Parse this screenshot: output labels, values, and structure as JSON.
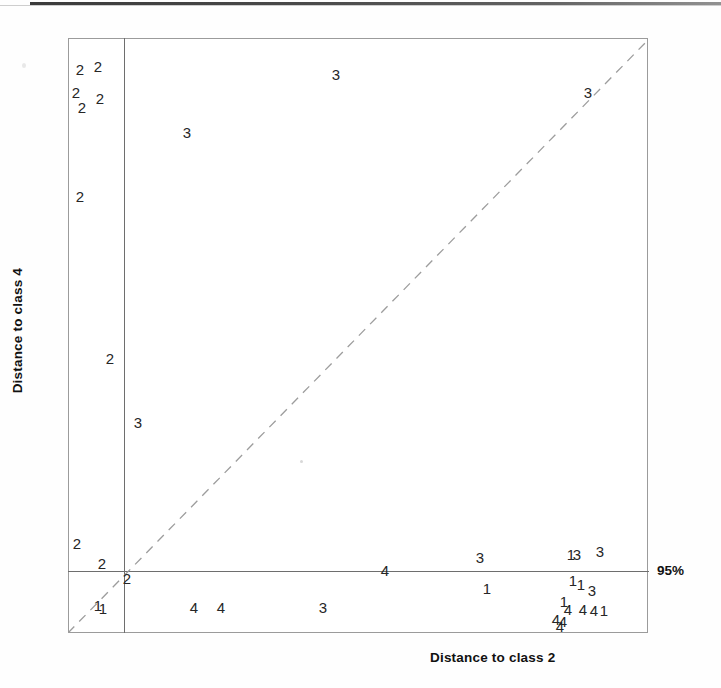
{
  "figure": {
    "type": "scatter-coomans-plot",
    "x_axis_title": "Distance to class 2",
    "y_axis_title": "Distance to class 4",
    "limit_label": "95%",
    "background": "#ffffff",
    "frame_color": "#9b9b9b",
    "limit_line_color": "#6e6e6e",
    "diagonal_color": "#9d9d9d",
    "marker_color": "#262626"
  },
  "chart_data": {
    "type": "scatter",
    "title": "",
    "xlabel": "Distance to class 2",
    "ylabel": "Distance to class 4",
    "xlim": [
      0,
      1
    ],
    "ylim": [
      0,
      1
    ],
    "grid": false,
    "legend": "none",
    "annotations": [
      {
        "text": "95%",
        "kind": "limit-line-label",
        "position": "right-of-horizontal-limit"
      }
    ],
    "reference_lines": [
      {
        "kind": "vertical-limit",
        "label": "95%",
        "x_px": 124
      },
      {
        "kind": "horizontal-limit",
        "label": "95%",
        "y_px": 571
      },
      {
        "kind": "diagonal",
        "style": "dashed",
        "from_px": [
          68,
          633
        ],
        "to_px": [
          648,
          40
        ]
      }
    ],
    "point_label_field": "class",
    "points": [
      {
        "label": "2",
        "x": 80,
        "y": 69
      },
      {
        "label": "2",
        "x": 98,
        "y": 66
      },
      {
        "label": "2",
        "x": 76,
        "y": 92
      },
      {
        "label": "2",
        "x": 100,
        "y": 98
      },
      {
        "label": "2",
        "x": 82,
        "y": 107
      },
      {
        "label": "2",
        "x": 80,
        "y": 196
      },
      {
        "label": "2",
        "x": 110,
        "y": 358
      },
      {
        "label": "2",
        "x": 77,
        "y": 543
      },
      {
        "label": "2",
        "x": 102,
        "y": 563
      },
      {
        "label": "2",
        "x": 127,
        "y": 578
      },
      {
        "label": "3",
        "x": 336,
        "y": 74
      },
      {
        "label": "3",
        "x": 588,
        "y": 92
      },
      {
        "label": "3",
        "x": 187,
        "y": 132
      },
      {
        "label": "3",
        "x": 138,
        "y": 422
      },
      {
        "label": "3",
        "x": 480,
        "y": 557
      },
      {
        "label": "3",
        "x": 600,
        "y": 551
      },
      {
        "label": "3",
        "x": 577,
        "y": 554
      },
      {
        "label": "3",
        "x": 592,
        "y": 590
      },
      {
        "label": "3",
        "x": 323,
        "y": 607
      },
      {
        "label": "1",
        "x": 571,
        "y": 554
      },
      {
        "label": "1",
        "x": 573,
        "y": 580
      },
      {
        "label": "1",
        "x": 581,
        "y": 584
      },
      {
        "label": "1",
        "x": 487,
        "y": 588
      },
      {
        "label": "1",
        "x": 98,
        "y": 605
      },
      {
        "label": "1",
        "x": 103,
        "y": 608
      },
      {
        "label": "1",
        "x": 564,
        "y": 601
      },
      {
        "label": "1",
        "x": 604,
        "y": 610
      },
      {
        "label": "4",
        "x": 385,
        "y": 570
      },
      {
        "label": "4",
        "x": 194,
        "y": 607
      },
      {
        "label": "4",
        "x": 221,
        "y": 607
      },
      {
        "label": "4",
        "x": 568,
        "y": 609
      },
      {
        "label": "4",
        "x": 583,
        "y": 609
      },
      {
        "label": "4",
        "x": 594,
        "y": 610
      },
      {
        "label": "4",
        "x": 556,
        "y": 619
      },
      {
        "label": "4",
        "x": 563,
        "y": 621
      },
      {
        "label": "4",
        "x": 560,
        "y": 626
      }
    ],
    "class_counts": {
      "1": 7,
      "2": 10,
      "3": 9,
      "4": 9
    }
  }
}
